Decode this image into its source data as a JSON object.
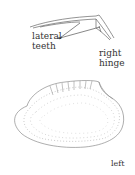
{
  "figure": {
    "labels": {
      "lateral_line1": "lateral",
      "lateral_line2": "teeth",
      "hinge_line1": "right",
      "hinge_line2": "hinge",
      "left": "left"
    },
    "colors": {
      "ink": "#555555",
      "text": "#333333",
      "background": "#ffffff"
    }
  }
}
